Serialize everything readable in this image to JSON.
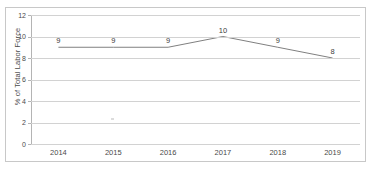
{
  "chart_data": {
    "type": "line",
    "title": "",
    "subtitle": "",
    "xlabel": "",
    "ylabel": "% of Total Labor Force",
    "categories": [
      "2014",
      "2015",
      "2016",
      "2017",
      "2018",
      "2019"
    ],
    "values": [
      9,
      9,
      9,
      10,
      9,
      8
    ],
    "point_labels": [
      "9",
      "9",
      "9",
      "10",
      "9",
      "8"
    ],
    "series": [
      {
        "name": "% of Total Labor Force",
        "values": [
          9,
          9,
          9,
          10,
          9,
          8
        ],
        "color": "#808080"
      }
    ],
    "ylim": [
      0,
      12
    ],
    "y_ticks": [
      12,
      10,
      8,
      6,
      4,
      2,
      0
    ],
    "y_tick_labels": [
      "12",
      "10",
      "8",
      "6",
      "4",
      "2",
      "0"
    ],
    "x_tick_labels": [
      "2014",
      "2015",
      "2016",
      "2017",
      "2018",
      "2019"
    ],
    "grid": true,
    "grid_axis": "y",
    "legend": false,
    "legend_position": "none",
    "markers": false,
    "data_labels": true
  },
  "colors": {
    "line": "#808080",
    "gridline": "#d2d2d2",
    "axis": "#b4b4b4",
    "frame_border": "#c8c8c8",
    "text": "#4a4a4a",
    "background": "#ffffff"
  }
}
